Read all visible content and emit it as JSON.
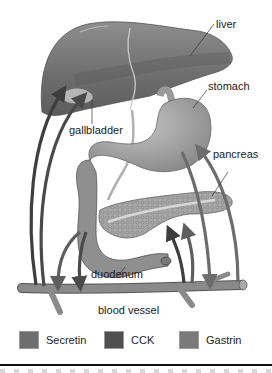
{
  "diagram": {
    "title": "",
    "labels": {
      "liver": "liver",
      "stomach": "stomach",
      "gallbladder": "gallbladder",
      "pancreas": "pancreas",
      "duodenum": "duodenum",
      "blood_vessel": "blood vessel"
    },
    "legend": [
      {
        "label": "Secretin",
        "color": "#6e6e6e"
      },
      {
        "label": "CCK",
        "color": "#4f4f4f"
      },
      {
        "label": "Gastrin",
        "color": "#7a7a7a"
      }
    ],
    "colors": {
      "organ_fill": "#8c8c8c",
      "organ_dark": "#6a6a6a",
      "organ_light": "#b0b0b0",
      "pancreas_fill": "#a8a8a8",
      "vessel_fill": "#8a8a8a",
      "arrow_secretin": "#5e5e5e",
      "arrow_cck": "#3e3e3e",
      "arrow_gastrin": "#6c6c6c",
      "background": "#ffffff"
    }
  }
}
